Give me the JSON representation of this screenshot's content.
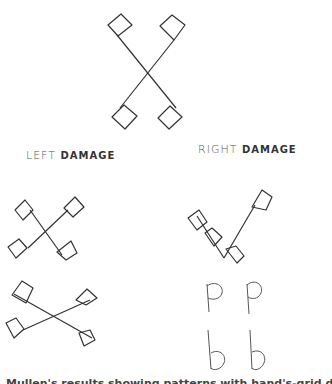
{
  "diagram": {
    "top_figure": {
      "name": "central-x-figure"
    },
    "labels": {
      "left_prefix": "LEFT",
      "left_suffix": "DAMAGE",
      "right_prefix": "RIGHT",
      "right_suffix": "DAMAGE"
    },
    "letters": [
      "p",
      "p",
      "b",
      "b"
    ],
    "caption": "Mullen's results showing patterns with hand's-grid display (cropped)",
    "colors": {
      "stroke": "#333333",
      "background": "#ffffff"
    }
  }
}
